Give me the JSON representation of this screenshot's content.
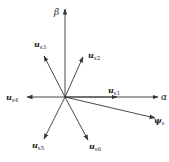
{
  "diagram": {
    "type": "space-vector-diagram",
    "origin": [
      65,
      97
    ],
    "axes": [
      {
        "name": "alpha",
        "label": "α",
        "end": [
          158,
          97
        ]
      },
      {
        "name": "beta",
        "label": "β",
        "end": [
          65,
          8
        ]
      }
    ],
    "vectors": [
      {
        "name": "u-s1",
        "base": "u",
        "sub": "s1",
        "end": [
          117,
          97
        ],
        "label_pos": [
          108,
          92
        ]
      },
      {
        "name": "u-s2",
        "base": "u",
        "sub": "s2",
        "end": [
          83,
          57
        ],
        "label_pos": [
          88,
          58
        ]
      },
      {
        "name": "u-s3",
        "base": "u",
        "sub": "s3",
        "end": [
          44,
          56
        ],
        "label_pos": [
          34,
          47
        ]
      },
      {
        "name": "u-s4",
        "base": "u",
        "sub": "s4",
        "end": [
          27,
          97
        ],
        "label_pos": [
          7,
          100
        ]
      },
      {
        "name": "u-s5",
        "base": "u",
        "sub": "s5",
        "end": [
          44,
          139
        ],
        "label_pos": [
          33,
          148
        ]
      },
      {
        "name": "u-s6",
        "base": "u",
        "sub": "s6",
        "end": [
          88,
          140
        ],
        "label_pos": [
          89,
          149
        ]
      }
    ],
    "flux": {
      "name": "psi-s",
      "base": "ψ",
      "sub": "s",
      "end": [
        155,
        118
      ],
      "label_pos": [
        155,
        125
      ]
    },
    "colors": {
      "stroke": "#333333",
      "text": "#222222"
    }
  },
  "labels": {
    "alpha": "α",
    "beta": "β",
    "u": "u",
    "s1": "s1",
    "s2": "s2",
    "s3": "s3",
    "s4": "s4",
    "s5": "s5",
    "s6": "s6",
    "psi": "ψ",
    "s": "s"
  }
}
